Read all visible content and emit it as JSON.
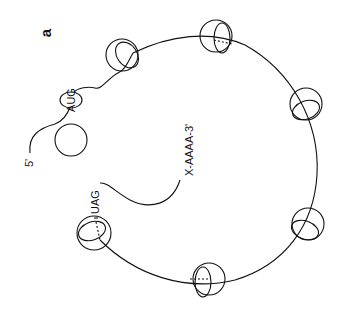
{
  "figure": {
    "panel_label": "a",
    "labels": {
      "five_prime": "5'",
      "start_codon": "AUG",
      "stop_codon": "UAG",
      "three_prime_tail": "X-AAAA-3'"
    },
    "colors": {
      "ink": "#111111",
      "background": "#ffffff"
    },
    "ribosome_count_on_mrna": 7,
    "free_subunit_count": 1
  }
}
